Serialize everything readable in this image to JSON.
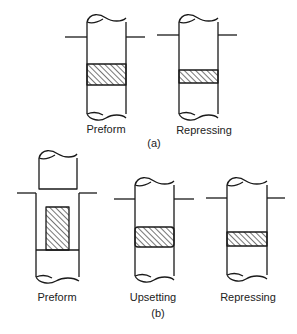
{
  "figure": {
    "part_a": {
      "caption": "(a)",
      "panels": [
        {
          "label": "Preform"
        },
        {
          "label": "Repressing"
        }
      ]
    },
    "part_b": {
      "caption": "(b)",
      "panels": [
        {
          "label": "Preform"
        },
        {
          "label": "Upsetting"
        },
        {
          "label": "Repressing"
        }
      ]
    }
  },
  "colors": {
    "stroke": "#1a1a1a",
    "background": "#ffffff"
  }
}
